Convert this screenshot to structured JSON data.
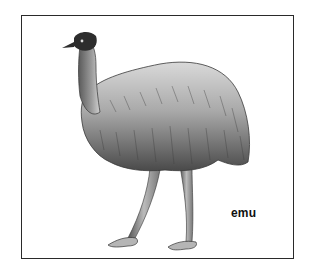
{
  "figure": {
    "subject": "emu",
    "label": "emu",
    "style": "pencil illustration, grayscale"
  },
  "colors": {
    "frame": "#2a2a2a",
    "ink": "#222222",
    "background": "#ffffff"
  }
}
